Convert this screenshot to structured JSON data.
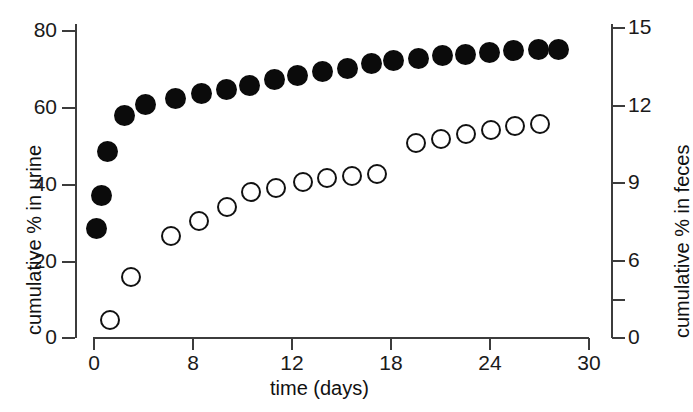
{
  "chart_data": {
    "type": "scatter",
    "title": "",
    "xlabel": "time (days)",
    "ylabel": "cumulative % in urine",
    "y2label": "cumulative % in feces",
    "xlim": [
      0,
      30
    ],
    "ylim": [
      0,
      80
    ],
    "y2lim": [
      0,
      15
    ],
    "grid": false,
    "legend_position": "none",
    "xticks": [
      0,
      8,
      12,
      18,
      24,
      30
    ],
    "xtick_labels": [
      "0",
      "8",
      "12",
      "18",
      "24",
      "30"
    ],
    "yticks": [
      0,
      20,
      40,
      60,
      80
    ],
    "ytick_labels": [
      "0",
      "20",
      "40",
      "60",
      "80"
    ],
    "y2ticks": [
      0,
      3,
      6,
      9,
      12,
      15
    ],
    "y2tick_labels": [
      "0",
      "",
      "6",
      "9",
      "12",
      "15"
    ],
    "series": [
      {
        "name": "cumulative % in urine",
        "marker": "filled-circle",
        "axis": "left",
        "color": "#0b0b0b",
        "x": [
          0.2,
          0.5,
          0.9,
          1.9,
          3.2,
          5.0,
          6.6,
          8.1,
          9.5,
          11.0,
          12.4,
          13.9,
          15.4,
          16.9,
          18.2,
          19.7,
          21.2,
          22.6,
          24.0,
          25.5,
          27.0,
          28.2
        ],
        "values": [
          28.2,
          37.0,
          48.3,
          57.7,
          60.6,
          62.1,
          63.4,
          64.6,
          65.6,
          67.0,
          68.2,
          69.3,
          69.9,
          71.2,
          72.1,
          72.7,
          73.3,
          73.6,
          74.2,
          74.6,
          74.8,
          74.9
        ]
      },
      {
        "name": "cumulative % in feces",
        "marker": "open-circle",
        "axis": "right",
        "color": "#111111",
        "x": [
          1.0,
          2.3,
          4.7,
          6.4,
          8.1,
          9.6,
          11.1,
          12.7,
          14.2,
          15.7,
          17.2,
          19.6,
          21.1,
          22.6,
          24.1,
          25.6,
          27.1
        ],
        "values": [
          0.8,
          2.9,
          4.9,
          5.6,
          6.3,
          7.0,
          7.2,
          7.5,
          7.7,
          7.8,
          7.9,
          9.4,
          9.6,
          9.8,
          10.0,
          10.2,
          10.3
        ]
      }
    ]
  },
  "axes": {
    "x_title": "time (days)",
    "y_left_title": "cumulative % in urine",
    "y_right_title": "cumulative % in feces"
  },
  "colors": {
    "axis": "#3c3c3c",
    "filled_marker": "#0b0b0b",
    "open_marker": "#111111",
    "background": "#ffffff",
    "text": "#1a1a1a"
  }
}
